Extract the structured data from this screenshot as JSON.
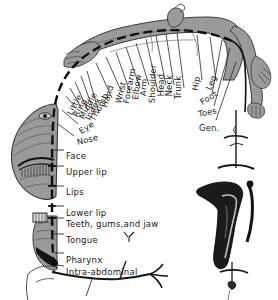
{
  "figure": {
    "colors": {
      "body_grey": "#9a9a9a",
      "body_grey_dark": "#6f6f6f",
      "ink": "#1a1a1a",
      "paper": "#ffffff"
    }
  },
  "arc_labels": [
    {
      "text": "Little",
      "x": 73,
      "y": 108,
      "rot": -62
    },
    {
      "text": "Ring",
      "x": 79,
      "y": 110,
      "rot": -62
    },
    {
      "text": "Middle",
      "x": 85,
      "y": 112,
      "rot": -62
    },
    {
      "text": "Index",
      "x": 91,
      "y": 113,
      "rot": -62
    },
    {
      "text": "Thumb",
      "x": 96,
      "y": 114,
      "rot": -62
    },
    {
      "text": "Eye",
      "x": 82,
      "y": 127,
      "rot": -33
    },
    {
      "text": "Nose",
      "x": 78,
      "y": 138,
      "rot": -14
    },
    {
      "text": "Hand",
      "x": 108,
      "y": 100,
      "rot": -72
    },
    {
      "text": "Wrist",
      "x": 122,
      "y": 96,
      "rot": -76
    },
    {
      "text": "Forearm",
      "x": 130,
      "y": 96,
      "rot": -79
    },
    {
      "text": "Elbow",
      "x": 139,
      "y": 92,
      "rot": -82
    },
    {
      "text": "Arm",
      "x": 147,
      "y": 88,
      "rot": -85
    },
    {
      "text": "Shoulder",
      "x": 156,
      "y": 95,
      "rot": -88
    },
    {
      "text": "Head",
      "x": 165,
      "y": 88,
      "rot": -90
    },
    {
      "text": "Neck",
      "x": 173,
      "y": 88,
      "rot": -90
    },
    {
      "text": "Trunk",
      "x": 182,
      "y": 91,
      "rot": -90
    },
    {
      "text": "Hip",
      "x": 199,
      "y": 83,
      "rot": -80
    },
    {
      "text": "Leg",
      "x": 212,
      "y": 83,
      "rot": -66
    },
    {
      "text": "Foot",
      "x": 203,
      "y": 98,
      "rot": -32
    },
    {
      "text": "Toes",
      "x": 199,
      "y": 110,
      "rot": -12
    },
    {
      "text": "Gen.",
      "x": 199,
      "y": 124,
      "rot": 0
    }
  ],
  "side_labels": [
    {
      "text": "Face",
      "x": 66,
      "y": 152
    },
    {
      "text": "Upper  lip",
      "x": 66,
      "y": 168
    },
    {
      "text": "Lips",
      "x": 66,
      "y": 188
    },
    {
      "text": "Lower  lip",
      "x": 66,
      "y": 209
    },
    {
      "text": "Teeth, gums,and  jaw",
      "x": 66,
      "y": 220
    },
    {
      "text": "Tongue",
      "x": 66,
      "y": 236
    },
    {
      "text": "Pharynx",
      "x": 66,
      "y": 256
    },
    {
      "text": "Intra-abdominal",
      "x": 66,
      "y": 268
    }
  ]
}
